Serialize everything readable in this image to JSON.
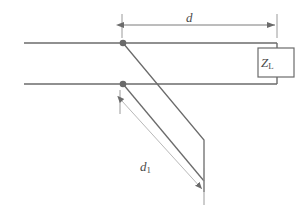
{
  "figure": {
    "background_color": "#ffffff",
    "line_color": "#6b6b6b",
    "dimension_line_color": "#8a8a8a",
    "text_color": "#4a4a4a",
    "node_color": "#6b6b6b"
  },
  "labels": {
    "distance_d": {
      "variable": "d",
      "subscript": "",
      "full_text": "d",
      "role": "dimension-label-top"
    },
    "distance_d1": {
      "variable": "d",
      "subscript": "1",
      "full_text": "d1",
      "role": "dimension-label-diagonal"
    },
    "load_impedance": {
      "variable": "Z",
      "subscript": "L",
      "full_text": "ZL",
      "role": "component-label"
    }
  },
  "geometry": {
    "transmission_line_top_y": 43,
    "transmission_line_bottom_y": 84,
    "line_start_x": 24,
    "line_end_x": 277,
    "junction_top": {
      "x": 123,
      "y": 43
    },
    "junction_bottom": {
      "x": 123,
      "y": 84
    },
    "load_box": {
      "x": 258,
      "y": 48,
      "width": 36,
      "height": 29
    },
    "dimension_d": {
      "y": 25,
      "x_start": 122,
      "x_end": 277
    },
    "dimension_d1": {
      "x_start": 120,
      "y_start": 99,
      "x_end": 203,
      "y_end": 190
    }
  },
  "components": {
    "load": {
      "name": "load-impedance-box",
      "label": "ZL"
    },
    "nodes": [
      {
        "name": "junction-node-top"
      },
      {
        "name": "junction-node-bottom"
      }
    ],
    "conductors": [
      {
        "name": "upper-conductor"
      },
      {
        "name": "lower-conductor"
      }
    ],
    "branches": [
      {
        "name": "stub-branch-upper"
      },
      {
        "name": "stub-branch-lower"
      }
    ]
  }
}
